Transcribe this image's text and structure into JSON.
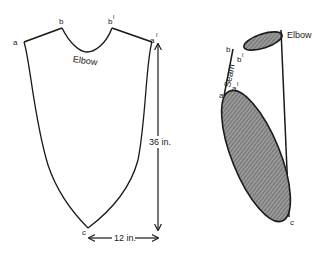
{
  "figure": {
    "flat_pattern": {
      "points": {
        "a": "a",
        "b": "b",
        "b1_base": "b",
        "b1_sup": "l",
        "a1_base": "a",
        "a1_sup": "l",
        "c": "c"
      },
      "elbow_label": "Elbow",
      "height_dimension": "36 in.",
      "width_dimension": "12 in."
    },
    "rolled_sleeve": {
      "points": {
        "b": "b",
        "b1_base": "b",
        "b1_sup": "l",
        "a": "a",
        "a1_base": "a",
        "a1_sup": "l",
        "c": "c"
      },
      "elbow_label": "Elbow",
      "seam_label": "Seam"
    },
    "colors": {
      "ink": "#1a1a1a",
      "hatch_fill": "#8a8a8a",
      "background": "#ffffff"
    }
  }
}
